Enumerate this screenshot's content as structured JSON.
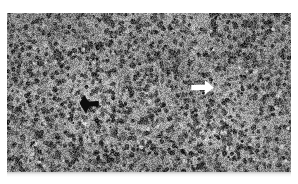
{
  "figure": {
    "kind": "photomicrograph",
    "modality": "light-microscopy",
    "stain_appearance": "grayscale",
    "tissue_description": "dense sheet of small round cells with hyperchromatic nuclei and scant cytoplasm",
    "caption": "",
    "background_color": "#ffffff"
  },
  "plate": {
    "x": 7,
    "y": 13,
    "width": 284,
    "height": 159,
    "mean_gray": "#8d8d8d",
    "light_gray": "#c8c8c8",
    "dark_gray": "#2a2a2a",
    "border": "none"
  },
  "texture": {
    "nuclei_count": 2600,
    "nucleus_min_radius": 1.1,
    "nucleus_max_radius": 2.6,
    "background_blotch_count": 70,
    "grain_amount": 0.34,
    "seed": 20240517,
    "light_patch": {
      "cx": 0.3,
      "cy": 0.56,
      "rx": 0.26,
      "ry": 0.22,
      "strength": 0.16
    },
    "vignette_strength": 0.05
  },
  "annotations": [
    {
      "name": "black-arrow",
      "color": "#0d0d0d",
      "direction": "right",
      "x": 78,
      "y": 94,
      "width": 22,
      "height": 21,
      "label": ""
    },
    {
      "name": "white-arrow",
      "color": "#ffffff",
      "direction": "right",
      "x": 190,
      "y": 79,
      "width": 25,
      "height": 17,
      "label": ""
    }
  ],
  "artifact_strip": {
    "present": true,
    "x": 7,
    "y": 172,
    "width": 284,
    "height": 5
  }
}
